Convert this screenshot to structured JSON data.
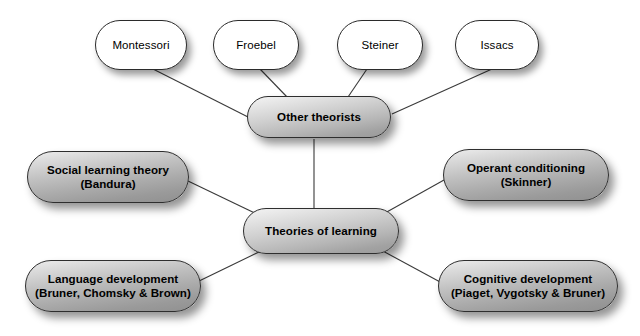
{
  "diagram": {
    "title": "Theories of learning",
    "type": "mind-map",
    "background_color": "#ffffff",
    "line_color": "#3a3a3a",
    "node_border_color": "#2b2b2b",
    "leaf_fill_color": "#ffffff",
    "grey_fill_top_color": "#f2f2f2",
    "grey_fill_bottom_color": "#999999",
    "nodes": [
      {
        "id": "montessori",
        "label": "Montessori",
        "style": "leaf",
        "x": 95,
        "y": 20,
        "w": 92,
        "h": 50
      },
      {
        "id": "froebel",
        "label": "Froebel",
        "style": "leaf",
        "x": 213,
        "y": 20,
        "w": 86,
        "h": 50
      },
      {
        "id": "steiner",
        "label": "Steiner",
        "style": "leaf",
        "x": 337,
        "y": 20,
        "w": 86,
        "h": 50
      },
      {
        "id": "issacs",
        "label": "Issacs",
        "style": "leaf",
        "x": 455,
        "y": 20,
        "w": 84,
        "h": 50
      },
      {
        "id": "other-theorists",
        "label": "Other theorists",
        "style": "grey",
        "x": 247,
        "y": 96,
        "w": 144,
        "h": 42
      },
      {
        "id": "social-learning-theory",
        "label": "Social learning theory\n(Bandura)",
        "style": "grey",
        "x": 27,
        "y": 151,
        "w": 162,
        "h": 52
      },
      {
        "id": "operant-conditioning",
        "label": "Operant conditioning\n(Skinner)",
        "style": "grey",
        "x": 443,
        "y": 149,
        "w": 166,
        "h": 52
      },
      {
        "id": "theories-of-learning",
        "label": "Theories of learning",
        "style": "grey",
        "x": 243,
        "y": 208,
        "w": 156,
        "h": 46
      },
      {
        "id": "language-development",
        "label": "Language development\n(Bruner, Chomsky & Brown)",
        "style": "grey",
        "x": 25,
        "y": 260,
        "w": 176,
        "h": 52
      },
      {
        "id": "cognitive-development",
        "label": "Cognitive development\n(Piaget, Vygotsky & Bruner)",
        "style": "grey",
        "x": 438,
        "y": 260,
        "w": 180,
        "h": 52
      }
    ],
    "edges": [
      {
        "id": "edge-montessori",
        "from": "montessori",
        "to": "other-theorists",
        "x1": 153,
        "y1": 69,
        "x2": 250,
        "y2": 118
      },
      {
        "id": "edge-froebel",
        "from": "froebel",
        "to": "other-theorists",
        "x1": 260,
        "y1": 69,
        "x2": 288,
        "y2": 98
      },
      {
        "id": "edge-steiner",
        "from": "steiner",
        "to": "other-theorists",
        "x1": 367,
        "y1": 69,
        "x2": 348,
        "y2": 97
      },
      {
        "id": "edge-issacs",
        "from": "issacs",
        "to": "other-theorists",
        "x1": 492,
        "y1": 69,
        "x2": 392,
        "y2": 114
      },
      {
        "id": "edge-other-theorists-center",
        "from": "other-theorists",
        "to": "theories-of-learning",
        "x1": 314,
        "y1": 139,
        "x2": 314,
        "y2": 209
      },
      {
        "id": "edge-social-learning",
        "from": "social-learning-theory",
        "to": "theories-of-learning",
        "x1": 188,
        "y1": 181,
        "x2": 259,
        "y2": 215
      },
      {
        "id": "edge-operant-conditioning",
        "from": "operant-conditioning",
        "to": "theories-of-learning",
        "x1": 444,
        "y1": 180,
        "x2": 385,
        "y2": 213
      },
      {
        "id": "edge-language-development",
        "from": "language-development",
        "to": "theories-of-learning",
        "x1": 195,
        "y1": 283,
        "x2": 263,
        "y2": 250
      },
      {
        "id": "edge-cognitive-development",
        "from": "cognitive-development",
        "to": "theories-of-learning",
        "x1": 442,
        "y1": 283,
        "x2": 381,
        "y2": 250
      }
    ]
  }
}
